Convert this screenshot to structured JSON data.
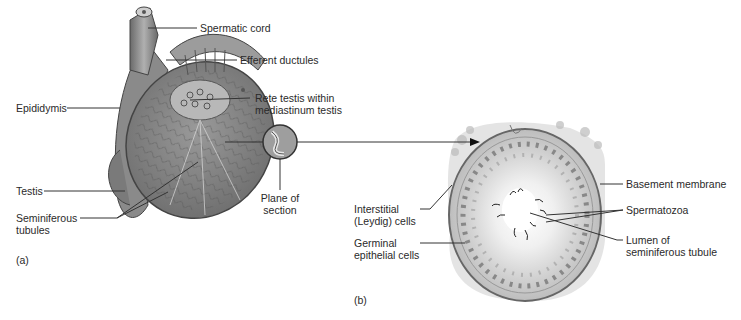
{
  "figure": {
    "panel_a": {
      "tag": "(a)",
      "labels": {
        "spermatic_cord": "Spermatic cord",
        "efferent_ductules": "Efferent ductules",
        "rete_testis_1": "Rete testis within",
        "rete_testis_2": "mediastinum testis",
        "epididymis": "Epididymis",
        "testis": "Testis",
        "seminiferous_1": "Seminiferous",
        "seminiferous_2": "tubules",
        "plane_1": "Plane of",
        "plane_2": "section"
      }
    },
    "panel_b": {
      "tag": "(b)",
      "labels": {
        "basement_membrane": "Basement membrane",
        "spermatozoa": "Spermatozoa",
        "lumen_1": "Lumen of",
        "lumen_2": "seminiferous tubule",
        "interstitial_1": "Interstitial",
        "interstitial_2": "(Leydig) cells",
        "germinal_1": "Germinal",
        "germinal_2": "epithelial cells"
      }
    }
  }
}
